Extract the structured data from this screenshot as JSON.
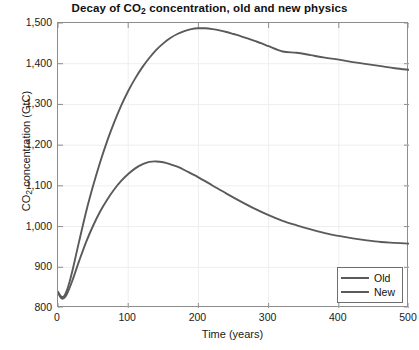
{
  "chart_data": {
    "type": "line",
    "title": "Decay of CO2 concentration, old and new physics",
    "title_prefix": "Decay of CO",
    "title_sub": "2",
    "title_suffix": " concentration, old and new physics",
    "xlabel": "Time (years)",
    "ylabel": "CO2 concentration (GtC)",
    "ylabel_prefix": "CO",
    "ylabel_sub": "2",
    "ylabel_suffix": " concentration (GtC)",
    "xlim": [
      0,
      500
    ],
    "ylim": [
      800,
      1500
    ],
    "xticks": [
      0,
      100,
      200,
      300,
      400,
      500
    ],
    "xtick_labels": [
      "0",
      "100",
      "200",
      "300",
      "400",
      "500"
    ],
    "yticks": [
      800,
      900,
      1000,
      1100,
      1200,
      1300,
      1400,
      1500
    ],
    "ytick_labels": [
      "800",
      "900",
      "1,000",
      "1,100",
      "1,200",
      "1,300",
      "1,400",
      "1,500"
    ],
    "grid": true,
    "legend_position": "bottom-right",
    "line_color": "#5a5a5a",
    "axis_color": "#8d8d8d",
    "grid_color": "#eeeeee",
    "series": [
      {
        "name": "Old",
        "color": "#5a5a5a",
        "x": [
          0,
          3,
          6,
          9,
          12,
          15,
          20,
          25,
          30,
          40,
          50,
          60,
          70,
          80,
          90,
          100,
          110,
          120,
          130,
          140,
          150,
          160,
          170,
          180,
          190,
          200,
          210,
          220,
          230,
          240,
          250,
          260,
          270,
          280,
          290,
          300,
          320,
          340,
          360,
          380,
          400,
          420,
          440,
          460,
          480,
          500
        ],
        "y": [
          840,
          831,
          827,
          830,
          840,
          855,
          888,
          925,
          963,
          1036,
          1100,
          1158,
          1210,
          1256,
          1297,
          1333,
          1364,
          1391,
          1414,
          1434,
          1450,
          1463,
          1473,
          1480,
          1485,
          1487,
          1487,
          1485,
          1482,
          1478,
          1473,
          1468,
          1462,
          1456,
          1450,
          1443,
          1430,
          1427,
          1421,
          1415,
          1410,
          1404,
          1399,
          1394,
          1389,
          1385
        ]
      },
      {
        "name": "New",
        "color": "#5a5a5a",
        "x": [
          0,
          3,
          6,
          9,
          12,
          15,
          20,
          25,
          30,
          40,
          50,
          60,
          70,
          80,
          90,
          100,
          110,
          120,
          130,
          140,
          150,
          160,
          170,
          180,
          190,
          200,
          220,
          240,
          260,
          280,
          300,
          320,
          340,
          360,
          380,
          400,
          420,
          440,
          460,
          480,
          500
        ],
        "y": [
          838,
          828,
          823,
          825,
          832,
          843,
          865,
          890,
          915,
          962,
          1002,
          1037,
          1066,
          1091,
          1112,
          1129,
          1143,
          1153,
          1159,
          1160,
          1158,
          1153,
          1147,
          1139,
          1130,
          1121,
          1101,
          1081,
          1062,
          1044,
          1028,
          1014,
          1003,
          993,
          984,
          977,
          971,
          966,
          962,
          960,
          958
        ]
      }
    ]
  },
  "legend": {
    "items": [
      {
        "label": "Old"
      },
      {
        "label": "New"
      }
    ]
  }
}
